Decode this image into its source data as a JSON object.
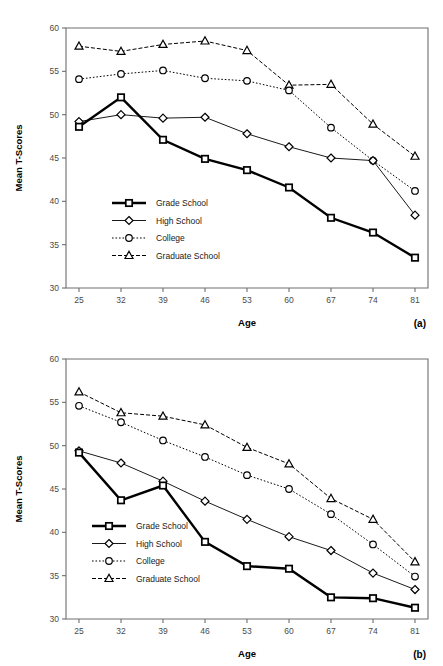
{
  "figure": {
    "background": "#ffffff",
    "axis_color": "#6e6e6e",
    "ink_color": "#000000"
  },
  "panels": [
    {
      "tag": "(a)",
      "xlabel": "Age",
      "ylabel": "Mean T-Scores"
    },
    {
      "tag": "(b)",
      "xlabel": "Age",
      "ylabel": "Mean T-Scores"
    }
  ],
  "legend": {
    "items": [
      {
        "label": "Grade School",
        "style": "thick-solid",
        "marker": "square"
      },
      {
        "label": "High School",
        "style": "thin-solid",
        "marker": "diamond"
      },
      {
        "label": "College",
        "style": "dotted",
        "marker": "circle"
      },
      {
        "label": "Graduate School",
        "style": "dash-dot",
        "marker": "triangle"
      }
    ]
  },
  "chart_data": [
    {
      "type": "line",
      "title": "",
      "panel": "(a)",
      "xlabel": "Age",
      "ylabel": "Mean T-Scores",
      "categories": [
        25,
        32,
        39,
        46,
        53,
        60,
        67,
        74,
        81
      ],
      "xticklabels": [
        "25",
        "32",
        "39",
        "46",
        "53",
        "60",
        "67",
        "74",
        "81"
      ],
      "yticks": [
        30,
        35,
        40,
        45,
        50,
        55,
        60
      ],
      "yticklabels": [
        "30",
        "35",
        "40",
        "45",
        "50",
        "55",
        "60"
      ],
      "ylim": [
        30,
        60
      ],
      "grid": false,
      "legend_position": "lower-left-inside",
      "series": [
        {
          "name": "Grade School",
          "marker": "square",
          "style": "thick-solid",
          "values": [
            48.6,
            52.0,
            47.1,
            44.9,
            43.6,
            41.6,
            38.1,
            36.4,
            33.5
          ]
        },
        {
          "name": "High School",
          "marker": "diamond",
          "style": "thin-solid",
          "values": [
            49.2,
            50.0,
            49.6,
            49.7,
            47.8,
            46.3,
            45.0,
            44.7,
            38.4
          ]
        },
        {
          "name": "College",
          "marker": "circle",
          "style": "dotted",
          "values": [
            54.1,
            54.7,
            55.1,
            54.2,
            53.9,
            52.8,
            48.5,
            44.7,
            41.2
          ]
        },
        {
          "name": "Graduate School",
          "marker": "triangle",
          "style": "dash-dot",
          "values": [
            57.9,
            57.3,
            58.1,
            58.5,
            57.4,
            53.4,
            53.5,
            48.9,
            45.2
          ]
        }
      ]
    },
    {
      "type": "line",
      "title": "",
      "panel": "(b)",
      "xlabel": "Age",
      "ylabel": "Mean T-Scores",
      "categories": [
        25,
        32,
        39,
        46,
        53,
        60,
        67,
        74,
        81
      ],
      "xticklabels": [
        "25",
        "32",
        "39",
        "46",
        "53",
        "60",
        "67",
        "74",
        "81"
      ],
      "yticks": [
        30,
        35,
        40,
        45,
        50,
        55,
        60
      ],
      "yticklabels": [
        "30",
        "35",
        "40",
        "45",
        "50",
        "55",
        "60"
      ],
      "ylim": [
        30,
        60
      ],
      "grid": false,
      "legend_position": "lower-left-inside",
      "series": [
        {
          "name": "Grade School",
          "marker": "square",
          "style": "thick-solid",
          "values": [
            49.2,
            43.7,
            45.4,
            38.9,
            36.1,
            35.8,
            32.5,
            32.4,
            31.3
          ]
        },
        {
          "name": "High School",
          "marker": "diamond",
          "style": "thin-solid",
          "values": [
            49.4,
            48.0,
            45.9,
            43.6,
            41.5,
            39.5,
            37.9,
            35.3,
            33.4
          ]
        },
        {
          "name": "College",
          "marker": "circle",
          "style": "dotted",
          "values": [
            54.6,
            52.7,
            50.6,
            48.7,
            46.6,
            45.0,
            42.1,
            38.6,
            34.9
          ]
        },
        {
          "name": "Graduate School",
          "marker": "triangle",
          "style": "dash-dot",
          "values": [
            56.2,
            53.8,
            53.4,
            52.4,
            49.8,
            47.9,
            43.9,
            41.5,
            36.6
          ]
        }
      ]
    }
  ]
}
